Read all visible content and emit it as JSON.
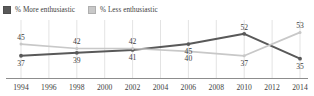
{
  "legend": {
    "position": "top-left",
    "items": [
      {
        "label": "% More enthusiastic",
        "color": "#595959",
        "swatch_icon": "square-swatch"
      },
      {
        "label": "% Less enthusiastic",
        "color": "#c8c8c8",
        "swatch_icon": "square-swatch"
      }
    ]
  },
  "chart_data": {
    "type": "line",
    "title": "",
    "subtitle": "",
    "xlabel": "",
    "ylabel": "",
    "grid": "vertical",
    "legend_position": "top-left",
    "categories": [
      "1994",
      "1996",
      "1998",
      "2000",
      "2002",
      "2004",
      "2006",
      "2008",
      "2010",
      "2012",
      "2014"
    ],
    "xlim": [
      "1994",
      "2014"
    ],
    "ylim": [
      30,
      56
    ],
    "series": [
      {
        "name": "% More enthusiastic",
        "color": "#595959",
        "label_positions": [
          "below",
          "below",
          "below",
          "below",
          "above",
          "below"
        ],
        "points": [
          {
            "x": "1994",
            "y": 37,
            "label": "37"
          },
          {
            "x": "1998",
            "y": 39,
            "label": "39"
          },
          {
            "x": "2002",
            "y": 41,
            "label": "41"
          },
          {
            "x": "2006",
            "y": 45,
            "label": "45"
          },
          {
            "x": "2010",
            "y": 52,
            "label": "52"
          },
          {
            "x": "2014",
            "y": 35,
            "label": "35"
          }
        ]
      },
      {
        "name": "% Less enthusiastic",
        "color": "#c8c8c8",
        "label_positions": [
          "above",
          "above",
          "above",
          "below",
          "below",
          "above"
        ],
        "points": [
          {
            "x": "1994",
            "y": 45,
            "label": "45"
          },
          {
            "x": "1998",
            "y": 42,
            "label": "42"
          },
          {
            "x": "2002",
            "y": 42,
            "label": "42"
          },
          {
            "x": "2006",
            "y": 40,
            "label": "40"
          },
          {
            "x": "2010",
            "y": 37,
            "label": "37"
          },
          {
            "x": "2014",
            "y": 53,
            "label": "53"
          }
        ]
      }
    ]
  },
  "colors": {
    "series_dark": "#595959",
    "series_light": "#c8c8c8",
    "gridline": "#dcdcdc",
    "axis": "#8d8d8d",
    "text": "#3d3d3d",
    "background": "#ffffff"
  }
}
